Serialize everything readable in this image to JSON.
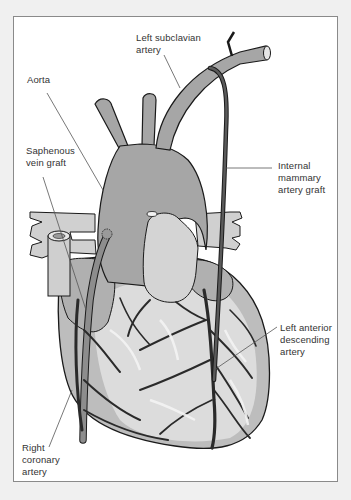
{
  "diagram": {
    "colors": {
      "background": "#f0f0f0",
      "frame_border": "#8a8a8a",
      "frame_fill": "#ffffff",
      "vessel_fill": "#a6a6a6",
      "heart_light": "#d8d8d8",
      "heart_mid": "#bdbdbd",
      "outline": "#1a1a1a",
      "leader_line": "#555555",
      "label_text": "#333333"
    },
    "labels": {
      "left_subclavian": "Left subclavian\nartery",
      "aorta": "Aorta",
      "saphenous": "Saphenous\nvein graft",
      "internal_mammary": "Internal\nmammary\nartery graft",
      "lad": "Left anterior\ndescending\nartery",
      "right_coronary": "Right\ncoronary\nartery"
    }
  }
}
